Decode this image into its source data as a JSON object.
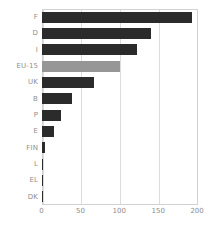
{
  "chart_data": {
    "type": "bar",
    "orientation": "horizontal",
    "title": "",
    "subtitle": "",
    "xlabel": "",
    "ylabel": "",
    "categories": [
      "F",
      "D",
      "I",
      "EU-15",
      "UK",
      "B",
      "P",
      "E",
      "FIN",
      "L",
      "EL",
      "DK"
    ],
    "values": [
      193,
      140,
      123,
      100,
      67,
      39,
      25,
      16,
      5,
      1,
      1,
      1
    ],
    "series": [
      {
        "name": "",
        "values": [
          193,
          140,
          123,
          100,
          67,
          39,
          25,
          16,
          5,
          1,
          1,
          1
        ]
      }
    ],
    "highlight_category": "EU-15",
    "xlim": [
      0,
      200
    ],
    "xticks": [
      0,
      50,
      100,
      150,
      200
    ],
    "xtick_labels": [
      "0",
      "50",
      "100",
      "150",
      "200"
    ],
    "grid": "vertical",
    "legend": "none",
    "colors": {
      "bar": "#2b2b2b",
      "bar_highlight": "#969696",
      "grid": "#dcdcdc",
      "frame": "#d2d2d2",
      "text": "#8e8e8e",
      "background": "#ffffff"
    }
  }
}
